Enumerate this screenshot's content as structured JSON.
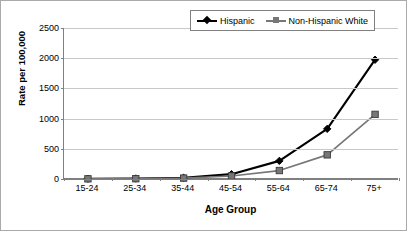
{
  "chart_data": {
    "type": "line",
    "title": "",
    "xlabel": "Age Group",
    "ylabel": "Rate per 100,000",
    "categories": [
      "15-24",
      "25-34",
      "35-44",
      "45-54",
      "55-64",
      "65-74",
      "75+"
    ],
    "series": [
      {
        "name": "Hispanic",
        "color": "#000000",
        "marker": "diamond",
        "values": [
          5,
          8,
          20,
          80,
          300,
          830,
          1975
        ]
      },
      {
        "name": "Non-Hispanic White",
        "color": "#777777",
        "marker": "square",
        "values": [
          3,
          5,
          15,
          50,
          140,
          400,
          1070
        ]
      }
    ],
    "ylim": [
      0,
      2500
    ],
    "yticks": [
      0,
      500,
      1000,
      1500,
      2000,
      2500
    ],
    "ytick_labels": [
      "0",
      "500",
      "1000",
      "1500",
      "2000",
      "2500"
    ],
    "grid": true,
    "legend_position": "top-right"
  },
  "colors": {
    "hispanic": "#000000",
    "non_hispanic_white": "#777777",
    "gridline": "#c8c8c8",
    "axis": "#808080",
    "background": "#ffffff"
  }
}
